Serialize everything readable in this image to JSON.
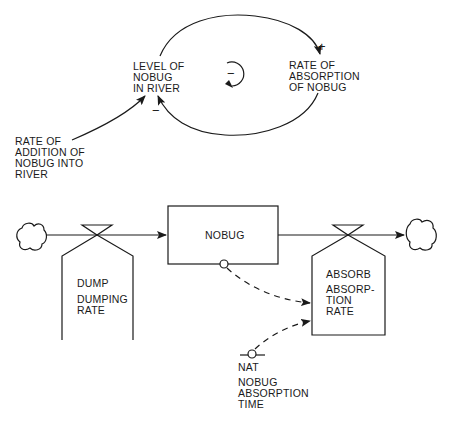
{
  "causal_loop": {
    "level_label": "LEVEL OF\nNOBUG\nIN RIVER",
    "absorption_label": "RATE OF\nABSORPTION\nOF NOBUG",
    "addition_label": "RATE OF\nADDITION OF\nNOBUG INTO\nRIVER",
    "plus_sign": "+",
    "minus_sign": "−",
    "loop_polarity": "−"
  },
  "flow_diagram": {
    "level": {
      "label": "NOBUG"
    },
    "inflow": {
      "code": "DUMP",
      "name": "DUMPING\nRATE"
    },
    "outflow": {
      "code": "ABSORB",
      "name": "ABSORP-\nTION\nRATE"
    },
    "constant": {
      "code": "NAT",
      "name": "NOBUG\nABSORPTION\nTIME"
    }
  },
  "colors": {
    "ink": "#1a1a1a",
    "background": "#ffffff"
  }
}
